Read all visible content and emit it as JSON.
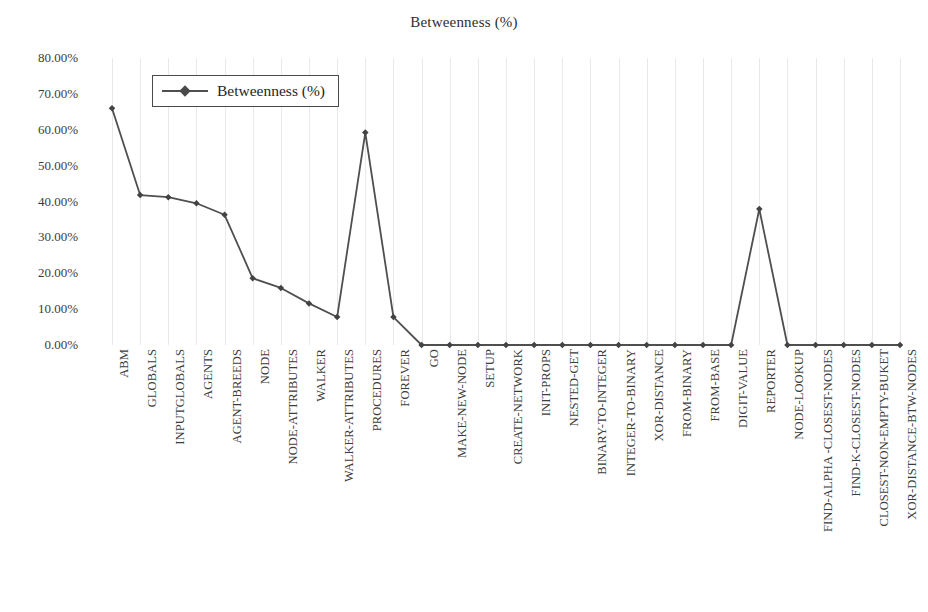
{
  "chart_data": {
    "type": "line",
    "title": "Betweenness (%)",
    "xlabel": "",
    "ylabel": "",
    "ylim": [
      0,
      80
    ],
    "ytick_values": [
      0,
      10,
      20,
      30,
      40,
      50,
      60,
      70,
      80
    ],
    "ytick_labels": [
      "0.00%",
      "10.00%",
      "20.00%",
      "30.00%",
      "40.00%",
      "50.00%",
      "60.00%",
      "70.00%",
      "80.00%"
    ],
    "grid": "vertical-only",
    "legend": [
      "Betweenness (%)"
    ],
    "legend_position": "top-left-inside",
    "series_name": "Betweenness (%)",
    "line_color": "#4f4f4f",
    "marker_color": "#434343",
    "marker": "diamond",
    "categories": [
      "ABM",
      "GLOBALS",
      "INPUTGLOBALS",
      "AGENTS",
      "AGENT-BREEDS",
      "NODE",
      "NODE-ATTRIBUTES",
      "WALKER",
      "WALKER-ATTRIBUTES",
      "PROCEDURES",
      "FOREVER",
      "GO",
      "MAKE-NEW-NODE",
      "SETUP",
      "CREATE-NETWORK",
      "INIT-PROPS",
      "NESTED-GET",
      "BINARY-TO-INTEGER",
      "INTEGER-TO-BINARY",
      "XOR-DISTANCE",
      "FROM-BINARY",
      "FROM-BASE",
      "DIGIT-VALUE",
      "REPORTER",
      "NODE-LOOKUP",
      "FIND-ALPHA -CLOSEST-NODES",
      "FIND-K-CLOSEST-NODES",
      "CLOSEST-NON-EMPTY-BUKET",
      "XOR-DISTANCE-BTW-NODES"
    ],
    "values": [
      66.0,
      41.8,
      41.2,
      39.5,
      36.3,
      18.6,
      15.9,
      11.6,
      7.8,
      59.2,
      7.8,
      0.0,
      0.0,
      0.0,
      0.0,
      0.0,
      0.0,
      0.0,
      0.0,
      0.0,
      0.0,
      0.0,
      0.0,
      37.9,
      0.0,
      0.0,
      0.0,
      0.0,
      0.0
    ]
  }
}
